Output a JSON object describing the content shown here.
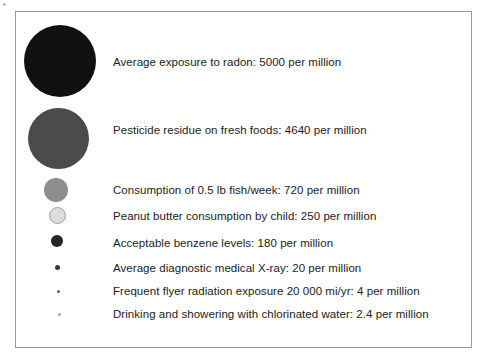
{
  "figure": {
    "title": "",
    "border_color": "#9a9a9a",
    "background": "#ffffff"
  },
  "chart_data": {
    "type": "bubble",
    "title": "",
    "subtitle": "",
    "xlabel": "",
    "ylabel": "",
    "units": "per million",
    "legend_position": "none",
    "grid": false,
    "note": "Area-proportional circles; each circle's area encodes the risk rate in cases per million.",
    "categories": [
      "Average exposure to radon",
      "Pesticide residue on fresh foods",
      "Consumption of 0.5 lb fish/week",
      "Peanut butter consumption by child",
      "Acceptable benzene levels",
      "Average diagnostic medical X-ray",
      "Frequent flyer radiation exposure 20 000 mi/yr",
      "Drinking and showering with chlorinated water"
    ],
    "values": [
      5000,
      4640,
      720,
      250,
      180,
      20,
      4,
      2.4
    ],
    "value_labels": [
      "5000",
      "4640",
      "720",
      "250",
      "180",
      "20",
      "4",
      "2.4"
    ],
    "items": [
      {
        "label": "Average exposure to radon: 5000 per million",
        "category": "Average exposure to radon",
        "value": 5000,
        "value_label": "5000",
        "color": "#111111",
        "diameter_px": 72,
        "cx": 60,
        "cy": 61,
        "text_y": 56,
        "stroke": "none"
      },
      {
        "label": "Pesticide residue on fresh foods: 4640 per million",
        "category": "Pesticide residue on fresh foods",
        "value": 4640,
        "value_label": "4640",
        "color": "#4b4b4b",
        "diameter_px": 61,
        "cx": 58,
        "cy": 138,
        "text_y": 124,
        "stroke": "none"
      },
      {
        "label": "Consumption of 0.5 lb fish/week: 720 per million",
        "category": "Consumption of 0.5 lb fish/week",
        "value": 720,
        "value_label": "720",
        "color": "#8e8e8e",
        "diameter_px": 24,
        "cx": 56,
        "cy": 190,
        "text_y": 184,
        "stroke": "none"
      },
      {
        "label": "Peanut butter consumption by child: 250 per million",
        "category": "Peanut butter consumption by child",
        "value": 250,
        "value_label": "250",
        "color": "#dcdcdc",
        "diameter_px": 17,
        "cx": 57,
        "cy": 215,
        "text_y": 210,
        "stroke": "#a0a0a0"
      },
      {
        "label": "Acceptable benzene levels: 180 per million",
        "category": "Acceptable benzene levels",
        "value": 180,
        "value_label": "180",
        "color": "#262626",
        "diameter_px": 12,
        "cx": 57,
        "cy": 241,
        "text_y": 237,
        "stroke": "none"
      },
      {
        "label": "Average diagnostic medical X-ray: 20 per million",
        "category": "Average diagnostic medical X-ray",
        "value": 20,
        "value_label": "20",
        "color": "#3a3a3a",
        "diameter_px": 5,
        "cx": 57,
        "cy": 267,
        "text_y": 262,
        "stroke": "none"
      },
      {
        "label": "Frequent flyer radiation exposure 20 000 mi/yr: 4 per million",
        "category": "Frequent flyer radiation exposure 20 000 mi/yr",
        "value": 4,
        "value_label": "4",
        "color": "#5e5e5e",
        "diameter_px": 3,
        "cx": 58,
        "cy": 291,
        "text_y": 285,
        "stroke": "none"
      },
      {
        "label": "Drinking and showering with chlorinated water: 2.4 per million",
        "category": "Drinking and showering with chlorinated water",
        "value": 2.4,
        "value_label": "2.4",
        "color": "#a8a8a8",
        "diameter_px": 3,
        "cx": 59,
        "cy": 314,
        "text_y": 308,
        "stroke": "none"
      }
    ]
  }
}
